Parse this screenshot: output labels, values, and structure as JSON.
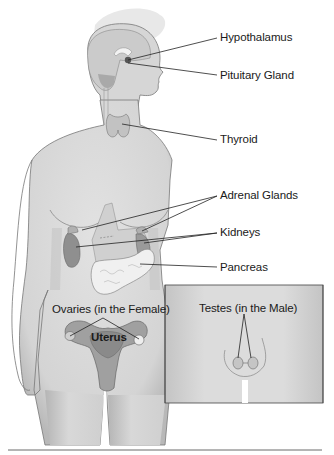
{
  "figure": {
    "labels": {
      "hypothalamus": "Hypothalamus",
      "pituitary": "Pituitary Gland",
      "thyroid": "Thyroid",
      "adrenal": "Adrenal Glands",
      "kidneys": "Kidneys",
      "pancreas": "Pancreas",
      "ovaries": "Ovaries (in the Female)",
      "uterus": "Uterus",
      "testes": "Testes (in the Male)"
    },
    "colors": {
      "skin": "#d9d9d9",
      "skin_shadow": "#bdbdbd",
      "halo": "#e6e6e6",
      "brain": "#c8c8c8",
      "organ_dark": "#8f8f8f",
      "organ_mid": "#a8a8a8",
      "pancreas": "#ededed",
      "outline": "#555555",
      "leader": "#222222",
      "inset_border": "#444444"
    }
  }
}
